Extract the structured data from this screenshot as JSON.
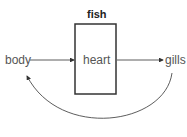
{
  "diagram": {
    "title": "fish",
    "nodes": {
      "body": "body",
      "heart": "heart",
      "gills": "gills"
    },
    "edges": [
      {
        "from": "body",
        "to": "heart"
      },
      {
        "from": "heart",
        "to": "gills"
      },
      {
        "from": "gills",
        "to": "body",
        "shape": "curve"
      }
    ],
    "colors": {
      "stroke": "#333333",
      "text": "#555555"
    }
  }
}
